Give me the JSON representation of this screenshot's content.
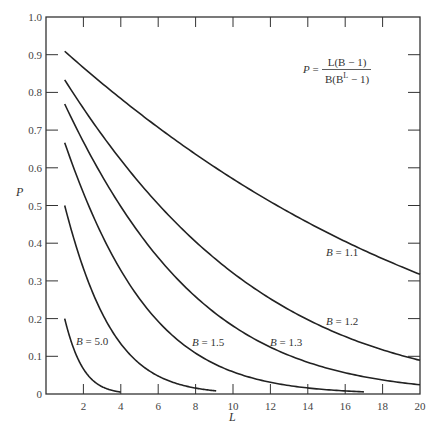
{
  "chart_data": {
    "type": "line",
    "title": "",
    "xlabel": "L",
    "ylabel": "P",
    "xlim": [
      0,
      20
    ],
    "ylim": [
      0,
      1.0
    ],
    "grid": false,
    "x_ticks": [
      2,
      4,
      6,
      8,
      10,
      12,
      14,
      16,
      18,
      20
    ],
    "y_ticks": [
      0,
      0.1,
      0.2,
      0.3,
      0.4,
      0.5,
      0.6,
      0.7,
      0.8,
      0.9,
      1.0
    ],
    "y_tick_labels": [
      "0",
      "0.1",
      "0.2",
      "0.3",
      "0.4",
      "0.5",
      "0.6",
      "0.7",
      "0.8",
      "0.9",
      "1.0"
    ],
    "formula": {
      "lhs": "P",
      "numerator": "L(B − 1)",
      "denominator_prefix": "B(B",
      "denominator_exp": "L",
      "denominator_suffix": " − 1)"
    },
    "series": [
      {
        "name": "B = 1.1",
        "B": 1.1,
        "label": "B = 1.1",
        "label_pos": [
          326,
          256
        ],
        "x": [
          1,
          2,
          3,
          4,
          5,
          6,
          7,
          8,
          9,
          10,
          12,
          14,
          16,
          18,
          20
        ],
        "values": [
          0.909,
          0.866,
          0.824,
          0.784,
          0.745,
          0.707,
          0.671,
          0.636,
          0.603,
          0.57,
          0.51,
          0.456,
          0.405,
          0.363,
          0.317
        ]
      },
      {
        "name": "B = 1.2",
        "B": 1.2,
        "label": "B = 1.2",
        "label_pos": [
          326,
          325
        ],
        "x": [
          1,
          2,
          3,
          4,
          5,
          6,
          7,
          8,
          9,
          10,
          12,
          14,
          16,
          18,
          20
        ],
        "values": [
          0.833,
          0.758,
          0.687,
          0.621,
          0.56,
          0.504,
          0.452,
          0.404,
          0.361,
          0.321,
          0.253,
          0.197,
          0.152,
          0.117,
          0.089
        ]
      },
      {
        "name": "B = 1.3",
        "B": 1.3,
        "label": "B = 1.3",
        "label_pos": [
          270,
          346
        ],
        "x": [
          1,
          2,
          3,
          4,
          5,
          6,
          7,
          8,
          9,
          10,
          12,
          14,
          16,
          18,
          20
        ],
        "values": [
          0.769,
          0.669,
          0.578,
          0.497,
          0.425,
          0.362,
          0.306,
          0.258,
          0.216,
          0.18,
          0.124,
          0.084,
          0.056,
          0.037,
          0.024
        ]
      },
      {
        "name": "B = 1.5",
        "B": 1.5,
        "label": "B = 1.5",
        "label_pos": [
          192,
          346
        ],
        "x": [
          1,
          2,
          3,
          4,
          5,
          6,
          7,
          8,
          9,
          10,
          12,
          14,
          16,
          17
        ],
        "values": [
          0.667,
          0.533,
          0.421,
          0.328,
          0.253,
          0.192,
          0.145,
          0.108,
          0.08,
          0.059,
          0.031,
          0.016,
          0.008,
          0.006
        ]
      },
      {
        "name": "B = 2.0",
        "B": 2.0,
        "label": "",
        "label_pos": null,
        "x": [
          1,
          2,
          3,
          4,
          5,
          6,
          7,
          8,
          9.1
        ],
        "values": [
          0.5,
          0.333,
          0.214,
          0.133,
          0.081,
          0.048,
          0.028,
          0.016,
          0.008
        ]
      },
      {
        "name": "B = 5.0",
        "B": 5.0,
        "label": "B = 5.0",
        "label_pos": [
          76,
          345
        ],
        "x": [
          1,
          1.5,
          2,
          2.5,
          3,
          3.5,
          4
        ],
        "values": [
          0.2,
          0.118,
          0.067,
          0.036,
          0.019,
          0.01,
          0.005
        ]
      }
    ],
    "legend": null
  }
}
